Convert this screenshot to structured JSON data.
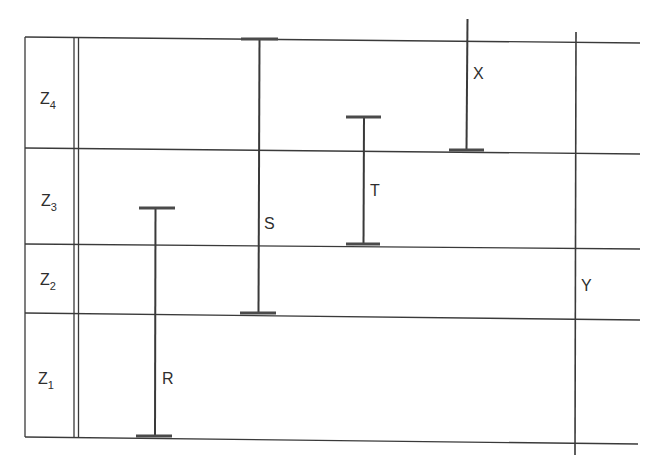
{
  "diagram": {
    "type": "stratigraphic-range-chart",
    "zones": [
      {
        "id": "Z4",
        "base": "Z",
        "subscript": "4"
      },
      {
        "id": "Z3",
        "base": "Z",
        "subscript": "3"
      },
      {
        "id": "Z2",
        "base": "Z",
        "subscript": "2"
      },
      {
        "id": "Z1",
        "base": "Z",
        "subscript": "1"
      }
    ],
    "ranges": [
      {
        "label": "R",
        "from_zone": "Z1 base",
        "to_zone": "Z3 (lower part)",
        "top_capped": true,
        "bottom_capped": true
      },
      {
        "label": "S",
        "from_zone": "Z2 (upper part)",
        "to_zone": "Z4 top",
        "top_capped": true,
        "bottom_capped": true
      },
      {
        "label": "T",
        "from_zone": "Z3 base",
        "to_zone": "Z4 (lower part)",
        "top_capped": true,
        "bottom_capped": true
      },
      {
        "label": "X",
        "from_zone": "Z4 base",
        "to_zone": "above Z4",
        "top_capped": false,
        "bottom_capped": true
      },
      {
        "label": "Y",
        "from_zone": "below Z1",
        "to_zone": "above Z4",
        "top_capped": false,
        "bottom_capped": false
      }
    ]
  }
}
